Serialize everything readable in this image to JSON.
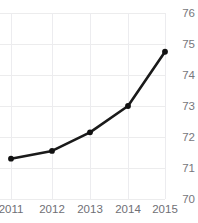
{
  "chart_data": {
    "type": "line",
    "title": "Freedom Trend",
    "xlabel": "",
    "ylabel": "",
    "categories": [
      "2011",
      "2012",
      "2013",
      "2014",
      "2015"
    ],
    "x": [
      2011,
      2012,
      2013,
      2014,
      2015
    ],
    "values": [
      71.3,
      71.55,
      72.15,
      73.0,
      74.75
    ],
    "series": [
      {
        "name": "Freedom Trend",
        "values": [
          71.3,
          71.55,
          72.15,
          73.0,
          74.75
        ]
      }
    ],
    "ylim": [
      70,
      76
    ],
    "xlim": [
      2011,
      2015
    ],
    "y_ticks": [
      76,
      75,
      74,
      73,
      72,
      71,
      70
    ],
    "y_tick_labels": [
      "76",
      "75",
      "74",
      "73",
      "72",
      "71",
      "70"
    ],
    "x_ticks": [
      2011,
      2012,
      2013,
      2014,
      2015
    ],
    "x_tick_labels": [
      "2011",
      "2012",
      "2013",
      "2014",
      "2015"
    ],
    "grid": true,
    "grid_axis": "both",
    "legend": false,
    "legend_position": "none",
    "y_axis_position": "right",
    "marker": "circle",
    "line_color": "#1a1a1a",
    "marker_color": "#111111",
    "grid_color": "#ececef",
    "tick_label_color": "#72727a",
    "title_color": "#3a3a3f",
    "background_color": "#ffffff",
    "annotations": []
  }
}
